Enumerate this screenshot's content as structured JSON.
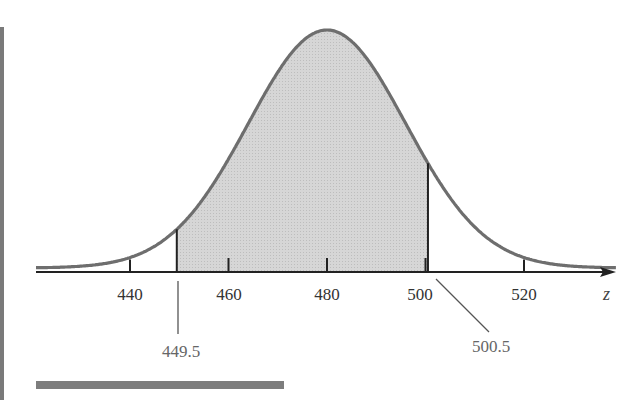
{
  "chart_data": {
    "type": "area",
    "title": "",
    "distribution": {
      "mean": 480,
      "std_dev": 16
    },
    "xlabel": "z",
    "ylabel": "",
    "xlim": [
      422,
      538
    ],
    "x_ticks": [
      440,
      460,
      480,
      500,
      520
    ],
    "tick_labels": [
      "440",
      "460",
      "480",
      "500",
      "520"
    ],
    "shaded_region": {
      "from": 449.5,
      "to": 500.5,
      "color": "#d0d0d0"
    },
    "annotations": [
      {
        "value": 449.5,
        "label": "449.5"
      },
      {
        "value": 500.5,
        "label": "500.5"
      }
    ],
    "grid": false,
    "legend": null
  },
  "labels": {
    "t440": "440",
    "t460": "460",
    "t480": "480",
    "t500": "500",
    "t520": "520",
    "axis_var": "z",
    "lower_bound": "449.5",
    "upper_bound": "500.5"
  },
  "colors": {
    "curve": "#6e6e6e",
    "shade": "#d0d0d0",
    "axis": "#222222"
  }
}
